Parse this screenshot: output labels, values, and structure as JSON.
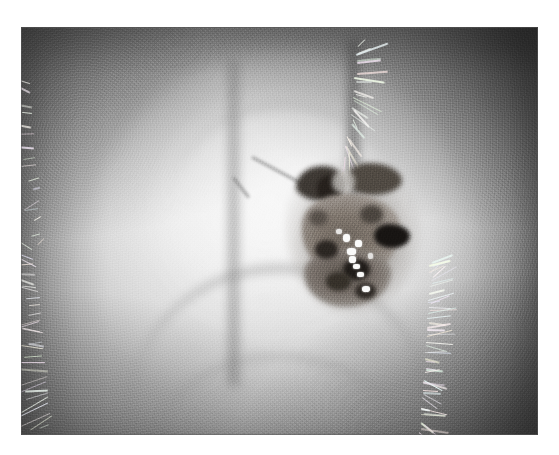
{
  "page": {
    "background_color": "#ffffff",
    "canvas_width": 559,
    "canvas_height": 455
  },
  "photograph": {
    "kind": "clinical-photograph",
    "modality": "grayscale",
    "subject": "pigmented skin lesion on hair-bearing skin",
    "frame": {
      "left": 21,
      "top": 27,
      "width": 517,
      "height": 408,
      "border_color": "#5a5a5a"
    },
    "palette": {
      "paper_white": "#ffffff",
      "highlight": "#e8e8e8",
      "midtone": "#b4b4b4",
      "shadow": "#7e7e7e",
      "flank_dark": "#3a3a3a",
      "lesion_mid": "#7d746b",
      "lesion_dark": "#241f1b",
      "lesion_black": "#171412",
      "speck_white": "#fbfbfa"
    },
    "regions": [
      {
        "name": "outer-skin-flanks",
        "description": "darker textured skin falling away on the far left and far right of the frame"
      },
      {
        "name": "hair-fringe-upper-right",
        "description": "spiky white hairs radiating along a dark curved crease in the upper right"
      },
      {
        "name": "hair-fringe-lower-right",
        "description": "dense white hair fringe against dark skin at the right edge"
      },
      {
        "name": "hair-fringe-lower-left",
        "description": "scattered long white hairs over dark skin at the lower left"
      },
      {
        "name": "hair-fringe-upper-left",
        "description": "sparse short white hairs at the upper left"
      },
      {
        "name": "central-dome",
        "description": "large bright oval swelling occupying the middle of the frame"
      },
      {
        "name": "inner-ring",
        "description": "a second, brighter concentric oval inside the dome"
      },
      {
        "name": "left-crease",
        "description": "soft dark vertical crease bounding the dome on its left"
      },
      {
        "name": "lower-arc",
        "description": "faint grey arc crossing the lower third of the dome"
      },
      {
        "name": "diagonal-streak",
        "description": "short dark diagonal scratch-like streak above the lesion"
      }
    ],
    "lesion": {
      "name": "pigmented-lesion",
      "position": "right of centre, upper-middle third",
      "frame_fraction": {
        "left": 0.54,
        "top": 0.35,
        "width": 0.205,
        "height": 0.33
      },
      "description": "irregular dark brown-black nodular mass with a bilobed upper margin, a very dark patch on its right flank, and a vertical line of bright white keratin specks down its centre",
      "features": [
        "bilobed dark upper horns",
        "mottled grey-brown body",
        "black patch on right margin",
        "nine bright white specks",
        "blurred lighter halo at the periphery"
      ],
      "speck_count": 9
    }
  }
}
